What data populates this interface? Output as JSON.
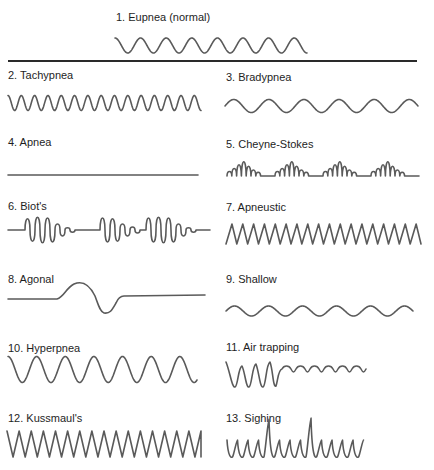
{
  "title": {
    "number": "1.",
    "name": "Eupnea",
    "note": "(normal)"
  },
  "patterns": [
    {
      "id": 1,
      "label": "1. Eupnea   (normal)",
      "shape": "regular sine, normal rate and depth"
    },
    {
      "id": 2,
      "label": "2. Tachypnea",
      "shape": "fast regular sine"
    },
    {
      "id": 3,
      "label": "3. Bradypnea",
      "shape": "slow regular sine"
    },
    {
      "id": 4,
      "label": "4. Apnea",
      "shape": "flat line"
    },
    {
      "id": 5,
      "label": "5. Cheyne-Stokes",
      "shape": "crescendo-decrescendo groups with pauses"
    },
    {
      "id": 6,
      "label": "6. Biot's",
      "shape": "irregular clusters of deep breaths with pauses"
    },
    {
      "id": 7,
      "label": "7. Apneustic",
      "shape": "sawtooth, prolonged inspiration"
    },
    {
      "id": 8,
      "label": "8. Agonal",
      "shape": "single slow gasp on flat line"
    },
    {
      "id": 9,
      "label": "9. Shallow",
      "shape": "low amplitude sine"
    },
    {
      "id": 10,
      "label": "10. Hyperpnea",
      "shape": "large amplitude sine"
    },
    {
      "id": 11,
      "label": "11. Air trapping",
      "shape": "rising baseline deep breaths then small ripples"
    },
    {
      "id": 12,
      "label": "12. Kussmaul's",
      "shape": "deep rapid zigzag"
    },
    {
      "id": 13,
      "label": "13. Sighing",
      "shape": "regular sine with intermittent tall sighs"
    }
  ],
  "colors": {
    "stroke": "#5a5a5a",
    "divider": "#2a2a2a",
    "text": "#1e1e1e",
    "background": "#ffffff"
  }
}
